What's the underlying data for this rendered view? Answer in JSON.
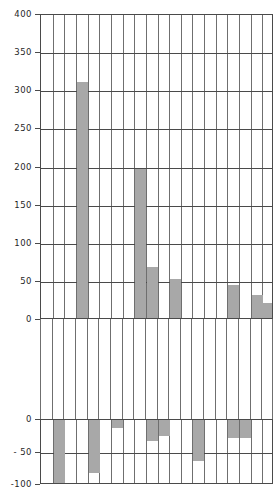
{
  "title_fragment": "",
  "chart_data": {
    "type": "bar",
    "title": "",
    "subtitle": "",
    "xlabel": "",
    "ylabel": "",
    "grid": true,
    "legend": false,
    "note": "Broken-axis paired panels: upper panel shows positive values (0 to 400), lower panel shows negative values (0 to -100). Each category has one positive and one negative value.",
    "categories": [
      "Food products",
      "Tobacco products",
      "Textile products",
      "Apparel",
      "Lumber products",
      "Furniture",
      "Paper products",
      "Printing",
      "Chemicals",
      "Petro-coal products",
      "Rubber-plastic",
      "Leather products",
      "Stone-clay-glass",
      "Primary metals",
      "Fabricated metals",
      "Machin. (non-elec.)",
      "Electric. machinery",
      "Transport equipment",
      "Instruments",
      "All Categories"
    ],
    "series": [
      {
        "name": "Positive",
        "panel": "upper",
        "ylim": [
          0,
          400
        ],
        "yticks": [
          0,
          50,
          100,
          150,
          200,
          250,
          300,
          350,
          400
        ],
        "values": [
          0,
          0,
          0,
          310,
          0,
          0,
          0,
          0,
          195,
          67,
          0,
          51,
          0,
          0,
          0,
          0,
          43,
          0,
          30,
          20
        ]
      },
      {
        "name": "Negative",
        "panel": "lower",
        "ylim": [
          -100,
          0
        ],
        "yticks": [
          0,
          -50,
          -100
        ],
        "values": [
          0,
          -98,
          0,
          0,
          -82,
          0,
          -12,
          0,
          0,
          -33,
          -24,
          0,
          0,
          -63,
          0,
          0,
          -27,
          -28,
          0,
          0
        ]
      }
    ],
    "upper_ylim": [
      0,
      400
    ],
    "upper_yticks": [
      "400",
      "350",
      "300",
      "250",
      "200",
      "150",
      "100",
      "50",
      "0"
    ],
    "lower_ylim": [
      -100,
      0
    ],
    "lower_yticks": [
      "0",
      "- 50",
      "-100"
    ],
    "bar_color": "#a8a8a8",
    "axis_color": "#4a4a4a",
    "grid_color": "#6f6f6f"
  }
}
